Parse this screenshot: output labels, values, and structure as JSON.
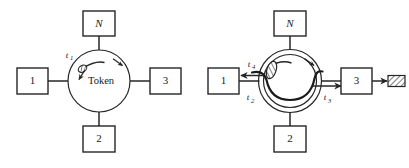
{
  "figure": {
    "stroke_color": "#262626",
    "fill_color": "#ffffff",
    "hatch_color": "#3a3a3a"
  },
  "left_diagram": {
    "name": "token-circulating",
    "stations": [
      {
        "id": "N",
        "label": "N",
        "italic": true,
        "position": "top"
      },
      {
        "id": "1",
        "label": "1",
        "italic": false,
        "position": "left"
      },
      {
        "id": "3",
        "label": "3",
        "italic": false,
        "position": "right"
      },
      {
        "id": "2",
        "label": "2",
        "italic": false,
        "position": "bottom"
      }
    ],
    "ring_label": "Token",
    "time_labels": [
      {
        "id": "t1",
        "base": "t",
        "sub": "1"
      }
    ],
    "rotation_direction": "clockwise",
    "token_icon": "hatched-token-icon",
    "direction_arrow_icon": "clockwise-arrowhead-icon"
  },
  "right_diagram": {
    "name": "frame-transmission",
    "stations": [
      {
        "id": "N",
        "label": "N",
        "italic": true,
        "position": "top"
      },
      {
        "id": "1",
        "label": "1",
        "italic": false,
        "position": "left"
      },
      {
        "id": "3",
        "label": "3",
        "italic": false,
        "position": "right"
      },
      {
        "id": "2",
        "label": "2",
        "italic": false,
        "position": "bottom"
      }
    ],
    "time_labels": [
      {
        "id": "t4",
        "base": "t",
        "sub": "4"
      },
      {
        "id": "t2",
        "base": "t",
        "sub": "2"
      },
      {
        "id": "t3",
        "base": "t",
        "sub": "3"
      }
    ],
    "rotation_direction": "clockwise",
    "token_icon": "hatched-token-icon",
    "frame_icon": "hatched-frame-icon",
    "direction_arrow_icon": "clockwise-arrowhead-icon",
    "arrow_icons": [
      "arrow-left-to-station-1-icon",
      "arrow-right-to-station-3-icon",
      "arrow-right-frame-out-icon"
    ]
  }
}
